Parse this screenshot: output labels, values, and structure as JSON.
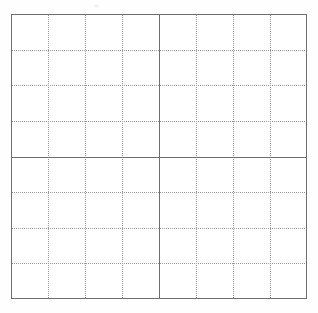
{
  "page": {
    "width": 318,
    "height": 313,
    "background_color": "#fefefe"
  },
  "grid": {
    "name": "ruled-grid-sheet",
    "box": {
      "left": 11,
      "top": 14,
      "width": 296,
      "height": 285,
      "border_color": "#6f6f6f",
      "border_width": 1,
      "fill_color": "#ffffff"
    },
    "columns": 8,
    "rows": 8,
    "minor_line_color": "#9a9a9a",
    "minor_line_style": "dotted",
    "major_line_color": "#6f6f6f",
    "major_line_style": "solid",
    "major_column_index": 4,
    "major_row_index": 4,
    "vertical_line_positions": [
      37,
      74,
      111,
      148,
      185,
      222,
      259
    ],
    "horizontal_line_positions": [
      35.6,
      71.2,
      106.9,
      142.5,
      178.1,
      213.7,
      249.4
    ],
    "major_vertical_position": 148,
    "major_horizontal_position": 142.5
  },
  "artifact": {
    "name": "scan-speck",
    "left": 94,
    "top": 4,
    "color": "#f3f3f3"
  }
}
